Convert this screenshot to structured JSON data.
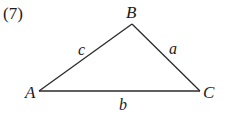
{
  "problem_number": "(7)",
  "triangle": {
    "vertices": {
      "A": {
        "label": "A",
        "x": 39,
        "y": 91
      },
      "B": {
        "label": "B",
        "x": 132,
        "y": 24
      },
      "C": {
        "label": "C",
        "x": 200,
        "y": 91
      }
    },
    "sides": {
      "a": {
        "label": "a",
        "between": [
          "B",
          "C"
        ]
      },
      "b": {
        "label": "b",
        "between": [
          "A",
          "C"
        ]
      },
      "c": {
        "label": "c",
        "between": [
          "A",
          "B"
        ]
      }
    }
  },
  "colors": {
    "line": "#2a2a2a",
    "text": "#1a1a1a",
    "background": "#ffffff"
  }
}
